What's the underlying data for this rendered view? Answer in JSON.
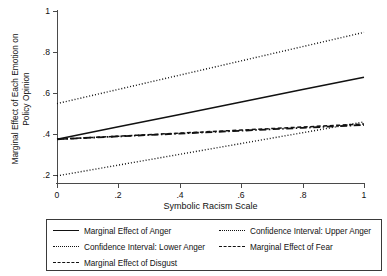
{
  "chart_data": {
    "type": "line",
    "title": "",
    "xlabel": "Symbolic Racism Scale",
    "ylabel": "Marginal Effect of Each Emotion on Policy Opinion",
    "ylabel_line1": "Marginal Effect of Each Emotion on",
    "ylabel_line2": "Policy Opinion",
    "xlim": [
      0,
      1
    ],
    "ylim": [
      0.155,
      1.0
    ],
    "xticks": [
      0,
      0.2,
      0.4,
      0.6,
      0.8,
      1
    ],
    "xticklabels": [
      "0",
      ".2",
      ".4",
      ".6",
      ".8",
      "1"
    ],
    "yticks": [
      0.2,
      0.4,
      0.6,
      0.8,
      1.0
    ],
    "yticklabels": [
      ".2",
      ".4",
      ".6",
      ".8",
      "1"
    ],
    "grid": false,
    "legend_position": "below-plot",
    "x": [
      0,
      0.2,
      0.4,
      0.6,
      0.8,
      1
    ],
    "series": [
      {
        "name": "Marginal Effect of Anger",
        "style": "solid",
        "values": [
          0.37,
          0.431,
          0.492,
          0.553,
          0.614,
          0.675
        ]
      },
      {
        "name": "Confidence Interval: Upper Anger",
        "style": "dotted",
        "values": [
          0.545,
          0.615,
          0.685,
          0.755,
          0.825,
          0.895
        ]
      },
      {
        "name": "Confidence Interval: Lower Anger",
        "style": "dotted",
        "values": [
          0.19,
          0.243,
          0.296,
          0.349,
          0.402,
          0.455
        ]
      },
      {
        "name": "Marginal Effect of Fear",
        "style": "dash-dot",
        "values": [
          0.37,
          0.384,
          0.398,
          0.412,
          0.426,
          0.44
        ]
      },
      {
        "name": "Marginal Effect of Disgust",
        "style": "dashed",
        "values": [
          0.37,
          0.385,
          0.4,
          0.415,
          0.43,
          0.445
        ]
      }
    ]
  },
  "legend": {
    "items": [
      {
        "label": "Marginal Effect of Anger",
        "style": "solid"
      },
      {
        "label": "Confidence Interval: Upper Anger",
        "style": "dotted"
      },
      {
        "label": "Confidence Interval: Lower Anger",
        "style": "dotted"
      },
      {
        "label": "Marginal Effect of Fear",
        "style": "dash-dot"
      },
      {
        "label": "Marginal Effect of Disgust",
        "style": "dashed"
      }
    ]
  },
  "axes": {
    "x_title": "Symbolic Racism Scale",
    "y_title_line1": "Marginal Effect of Each Emotion on",
    "y_title_line2": "Policy Opinion",
    "x_tick_labels": [
      "0",
      ".2",
      ".4",
      ".6",
      ".8",
      "1"
    ],
    "y_tick_labels": [
      "1",
      ".8",
      ".6",
      ".4",
      ".2"
    ]
  },
  "colors": {
    "line": "#111111",
    "axis": "#4a4a4a",
    "background": "#ffffff"
  }
}
